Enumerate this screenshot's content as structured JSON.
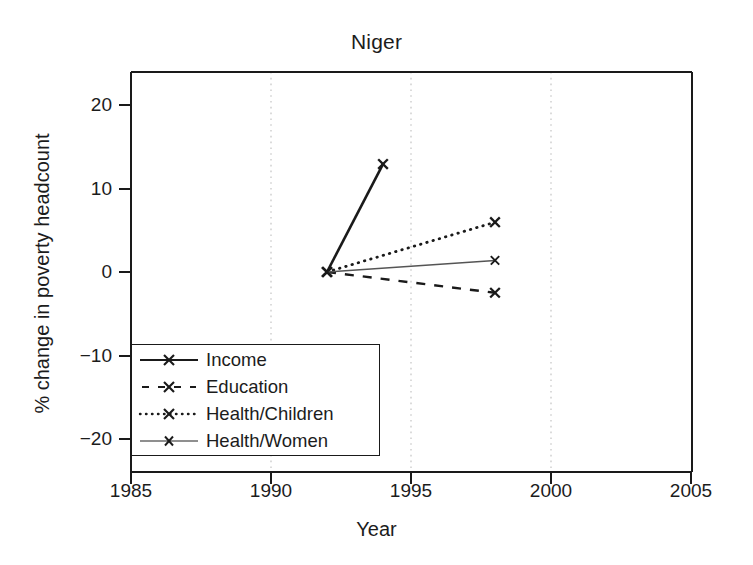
{
  "chart_data": {
    "type": "line",
    "title": "Niger",
    "xlabel": "Year",
    "ylabel": "% change in poverty headcount",
    "xlim": [
      1985,
      2005
    ],
    "ylim": [
      -24,
      24
    ],
    "xticks": [
      1985,
      1990,
      1995,
      2000,
      2005
    ],
    "yticks": [
      20,
      10,
      0,
      -10,
      -20
    ],
    "grid": "vertical dotted gridlines at 1990, 1995, 2000",
    "legend_position": "lower-left inside axes",
    "marker": "x",
    "series": [
      {
        "name": "Income",
        "style": "solid",
        "color": "#1a1a1a",
        "x": [
          1992,
          1994
        ],
        "values": [
          0,
          13.0
        ]
      },
      {
        "name": "Education",
        "style": "dashed",
        "color": "#1a1a1a",
        "x": [
          1992,
          1998
        ],
        "values": [
          0,
          -2.5
        ]
      },
      {
        "name": "Health/Children",
        "style": "dotted",
        "color": "#1a1a1a",
        "x": [
          1992,
          1998
        ],
        "values": [
          0,
          6.0
        ]
      },
      {
        "name": "Health/Women",
        "style": "thin-solid",
        "color": "#555555",
        "x": [
          1992,
          1998
        ],
        "values": [
          0,
          1.4
        ]
      }
    ]
  },
  "legend": {
    "items": [
      {
        "label": "Income"
      },
      {
        "label": "Education"
      },
      {
        "label": "Health/Children"
      },
      {
        "label": "Health/Women"
      }
    ]
  },
  "axis": {
    "ytick_labels": [
      "20",
      "10",
      "0",
      "−10",
      "−20"
    ],
    "xtick_labels": [
      "1985",
      "1990",
      "1995",
      "2000",
      "2005"
    ]
  }
}
